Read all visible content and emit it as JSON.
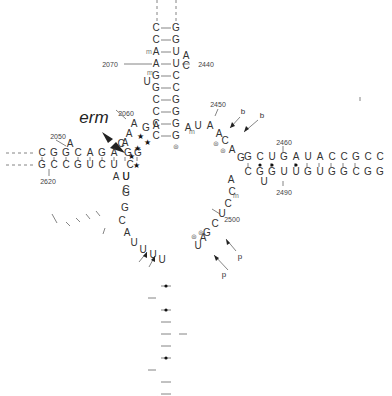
{
  "annotation": {
    "label": "erm"
  },
  "top_helix": {
    "five_prime": [
      "C",
      "C",
      "A",
      "A",
      "G",
      "G",
      "C",
      "C",
      "C",
      "C"
    ],
    "three_prime": [
      "G",
      "G",
      "U",
      "U",
      "C",
      "C",
      "G",
      "G",
      "G",
      "G"
    ],
    "bulge_right": [
      "A",
      "C"
    ],
    "bulge_left": "U",
    "numbers": {
      "n2070": "2070",
      "n2440": "2440"
    }
  },
  "left_helix": {
    "top_strand": [
      "C",
      "G",
      "G",
      "C",
      "A",
      "G",
      "A"
    ],
    "bottom_strand": [
      "G",
      "C",
      "C",
      "G",
      "U",
      "C",
      "U"
    ],
    "bulge_top": [
      "A",
      "C"
    ],
    "bulge_bottom": [
      "A",
      "U"
    ],
    "numbers": {
      "n2050": "2050",
      "n2620": "2620"
    }
  },
  "central_loop": {
    "junction_top_left": [
      "G",
      "G",
      "A",
      "A",
      "A",
      "G",
      "A"
    ],
    "junction_top_right": [
      "A",
      "U",
      "A",
      "A",
      "C",
      "A",
      "G"
    ],
    "junction_left": [
      "C",
      "U",
      "G",
      "G",
      "C",
      "A",
      "U",
      "U",
      "U",
      "U",
      "G"
    ],
    "junction_right": [
      "A",
      "C",
      "C",
      "U",
      "C",
      "G",
      "A",
      "U",
      "U"
    ],
    "numbers": {
      "n2060": "2060",
      "n2450": "2450",
      "n2500": "2500"
    }
  },
  "right_helix": {
    "top_strand": [
      "G",
      "C",
      "U",
      "G",
      "A",
      "U",
      "A",
      "C",
      "C",
      "G",
      "C",
      "C"
    ],
    "bottom_strand": [
      "C",
      "G",
      "G",
      "U",
      "U",
      "G",
      "U",
      "G",
      "G",
      "C",
      "G",
      "G"
    ],
    "bulge_bottom": "U",
    "loop": [
      "C",
      "A",
      "A",
      "G",
      "A",
      "G",
      "U",
      "U",
      "C",
      "A",
      "U",
      "A",
      "U",
      "C",
      "G",
      "A",
      "C"
    ],
    "numbers": {
      "n2460": "2460",
      "n2470": "2470",
      "n2480": "2480",
      "n2490": "2490"
    }
  },
  "lower_left_helix": {
    "outer": [
      "A",
      "G",
      "A",
      "C",
      "G",
      "U",
      "U",
      "G"
    ],
    "inner": [
      "C",
      "U",
      "G",
      "C",
      "A",
      "A",
      "C"
    ],
    "loop": [
      "G",
      "U",
      "G"
    ],
    "numbers": {
      "n2600": "2600",
      "n2590": "2590"
    }
  },
  "bottom_helix": {
    "left": [
      "G",
      "G",
      "U",
      "C",
      "G",
      "A",
      "G",
      "U",
      "G",
      "G",
      "U",
      "G"
    ],
    "right": [
      "U",
      "C",
      "G",
      "G",
      "C",
      "U",
      "C",
      "A",
      "U",
      "C",
      "A",
      "C"
    ],
    "bulge": [
      "G",
      "C",
      "C",
      "A"
    ],
    "numbers": {
      "n2580": "2580",
      "n2510": "2510",
      "n2570": "2570"
    }
  },
  "marks": {
    "b": "b",
    "p": "p"
  }
}
